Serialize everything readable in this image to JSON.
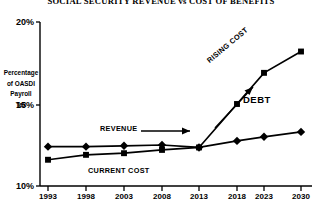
{
  "chart_data": {
    "type": "line",
    "title": "SOCIAL SECURITY REVENUE vs COST OF BENEFITS",
    "xlabel": "",
    "ylabel": "Percentage of OASDI Payroll Tax",
    "ylabel_lines": [
      "Percentage",
      "of OASDI",
      "Payroll",
      "Tax"
    ],
    "categories": [
      "1993",
      "1998",
      "2003",
      "2008",
      "2013",
      "2018",
      "2023",
      "2030"
    ],
    "x": [
      1993,
      1998,
      2003,
      2008,
      2013,
      2018,
      2023,
      2030
    ],
    "xlim": [
      1993,
      2030
    ],
    "ylim": [
      10,
      20
    ],
    "yticks": [
      10,
      15,
      20
    ],
    "ytick_labels": [
      "10%",
      "15%",
      "20%"
    ],
    "grid": false,
    "legend_position": "none",
    "series": [
      {
        "name": "REVENUE",
        "marker": "diamond",
        "color": "#000000",
        "values": [
          12.4,
          12.4,
          12.45,
          12.5,
          12.35,
          12.75,
          13.0,
          13.3
        ]
      },
      {
        "name": "COST",
        "marker": "square",
        "color": "#000000",
        "values": [
          11.6,
          11.9,
          12.0,
          12.2,
          12.35,
          15.0,
          16.9,
          18.2
        ]
      }
    ],
    "annotations": [
      {
        "id": "revenue",
        "text": "REVENUE",
        "arrow": "right"
      },
      {
        "id": "current-cost",
        "text": "CURRENT COST",
        "arrow": "none"
      },
      {
        "id": "rising-cost",
        "text": "RISING COST",
        "arrow": "up-right"
      },
      {
        "id": "debt",
        "text": "DEBT",
        "arrow": "none"
      }
    ]
  },
  "axes": {
    "y_ticks": [
      {
        "label": "20%",
        "value": 20
      },
      {
        "label": "15%",
        "value": 15
      },
      {
        "label": "10%",
        "value": 10
      }
    ],
    "x_ticks": [
      {
        "label": "1993"
      },
      {
        "label": "1998"
      },
      {
        "label": "2003"
      },
      {
        "label": "2008"
      },
      {
        "label": "2013"
      },
      {
        "label": "2018"
      },
      {
        "label": "2023"
      },
      {
        "label": "2030"
      }
    ]
  },
  "colors": {
    "ink": "#000000",
    "background": "#ffffff"
  }
}
